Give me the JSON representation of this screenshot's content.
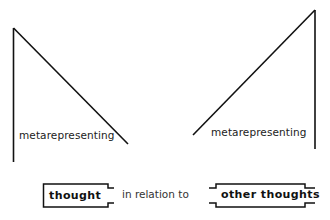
{
  "diagram": {
    "left_figure": {
      "label": "metarepresenting",
      "shape": "vertical line with descending diagonal"
    },
    "right_figure": {
      "label": "metarepresenting",
      "shape": "vertical line with ascending diagonal (mirrored)"
    },
    "bottom_row": {
      "left_box": "thought",
      "connector": "in relation to",
      "right_box": "other thoughts"
    },
    "colors": {
      "line": "#111111",
      "background": "#ffffff",
      "text": "#222222"
    }
  }
}
